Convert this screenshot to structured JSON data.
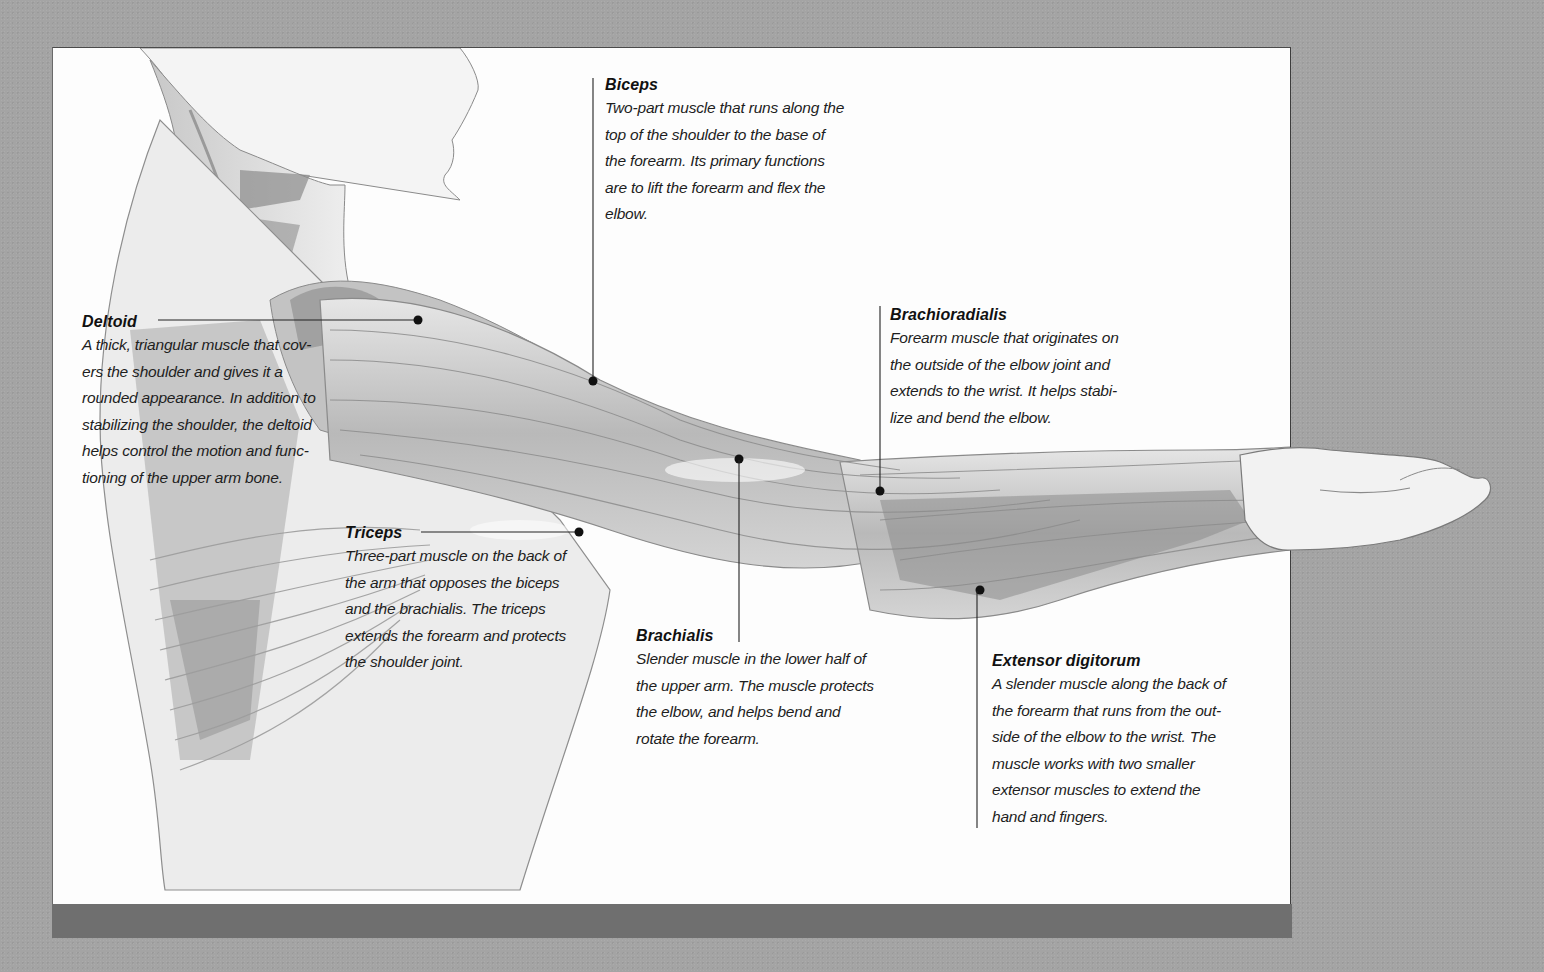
{
  "diagram": {
    "colors": {
      "page_background": "#a4a4a4",
      "panel_background": "#fdfdfd",
      "bottom_bar": "#6f6f6f",
      "text": "#161616",
      "leader_line": "#222222"
    },
    "labels": [
      {
        "id": "biceps",
        "title": "Biceps",
        "lines": [
          "Two-part muscle that runs along the",
          "top of the shoulder to the base of",
          "the forearm. Its primary functions",
          "are to lift the forearm and flex the",
          "elbow."
        ]
      },
      {
        "id": "deltoid",
        "title": "Deltoid",
        "lines": [
          "A thick, triangular muscle that cov-",
          "ers the shoulder and gives it a",
          "rounded appearance. In addition to",
          "stabilizing the shoulder, the deltoid",
          "helps control the motion and func-",
          "tioning of the upper arm bone."
        ]
      },
      {
        "id": "brachioradialis",
        "title": "Brachioradialis",
        "lines": [
          "Forearm muscle that originates on",
          "the outside of the elbow joint and",
          "extends to the wrist. It helps stabi-",
          "lize and bend the elbow."
        ]
      },
      {
        "id": "triceps",
        "title": "Triceps",
        "lines": [
          "Three-part muscle on the back of",
          "the arm that opposes the biceps",
          "and the brachialis. The triceps",
          "extends the forearm and protects",
          "the shoulder joint."
        ]
      },
      {
        "id": "brachialis",
        "title": "Brachialis",
        "lines": [
          "Slender muscle in the lower half of",
          "the upper arm. The muscle protects",
          "the elbow, and helps bend and",
          "rotate the forearm."
        ]
      },
      {
        "id": "extensor_digitorum",
        "title": "Extensor digitorum",
        "lines": [
          "A slender muscle  along the back of",
          "the forearm that runs from the out-",
          "side of the elbow to the wrist. The",
          "muscle works with two smaller",
          "extensor muscles to extend the",
          "hand and fingers."
        ]
      }
    ]
  }
}
